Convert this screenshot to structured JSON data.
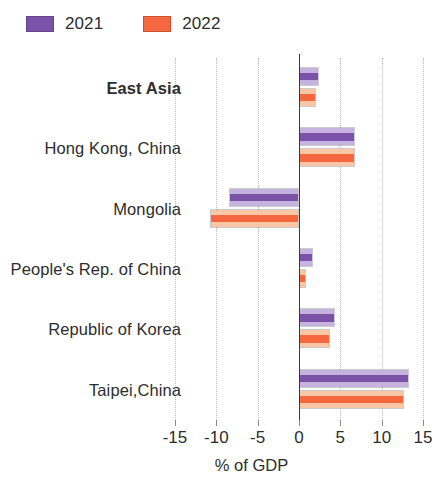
{
  "legend": {
    "items": [
      {
        "label": "2021",
        "color": "#7a52a8",
        "light": "#c6b2de"
      },
      {
        "label": "2022",
        "color": "#f4673f",
        "light": "#f9c6a6"
      }
    ]
  },
  "axis": {
    "title": "% of GDP",
    "ticks": [
      "-15",
      "-10",
      "-5",
      "0",
      "5",
      "10",
      "15"
    ]
  },
  "chart_data": {
    "type": "bar",
    "orientation": "horizontal",
    "title": "",
    "subtitle": "",
    "xlabel": "% of GDP",
    "ylabel": "",
    "xlim": [
      -15,
      15
    ],
    "xticks": [
      -15,
      -10,
      -5,
      0,
      5,
      10,
      15
    ],
    "grid": true,
    "legend_position": "top-left",
    "categories": [
      "East Asia",
      "Hong Kong, China",
      "Mongolia",
      "People's Rep. of China",
      "Republic of Korea",
      "Taipei,China"
    ],
    "emphasized_categories": [
      "East Asia"
    ],
    "series": [
      {
        "name": "2021",
        "color": "#7a52a8",
        "values": [
          2.4,
          6.8,
          -8.5,
          1.7,
          4.4,
          13.3
        ]
      },
      {
        "name": "2022",
        "color": "#f4673f",
        "values": [
          2.0,
          6.8,
          -10.8,
          0.9,
          3.8,
          12.7
        ]
      }
    ]
  }
}
